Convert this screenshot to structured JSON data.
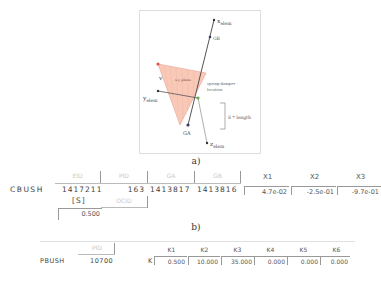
{
  "figure_a": {
    "caption": "a)",
    "labels": {
      "x_elem": "x",
      "x_elem_sub": "elem",
      "y_elem": "y",
      "y_elem_sub": "elem",
      "z_elem": "z",
      "z_elem_sub": "elem",
      "gb": "GB",
      "ga": "GA",
      "plane": "x-y plane",
      "v": "v",
      "spring_damper": "spring-damper",
      "location": "location",
      "s_length": "S * length"
    },
    "colors": {
      "plane_fill": "#f9c9b8",
      "plane_edge": "#e8a090",
      "v_point": "#d9534f",
      "spring_point": "#6ab04c",
      "axis_line": "#555555",
      "node": "#3a3a6a"
    }
  },
  "figure_b": {
    "caption": "b)",
    "card_name": "CBUSH",
    "row1_headers": [
      "EID",
      "PID",
      "GA",
      "GB"
    ],
    "row1_values": [
      "1417211",
      "163",
      "1413817",
      "1413816"
    ],
    "x_headers": [
      "X1",
      "X2",
      "X3"
    ],
    "x_values": [
      "4.7e-02",
      "-2.5e-01",
      "-9.7e-01"
    ],
    "row2_headers": [
      "[S]",
      "OCID"
    ],
    "s_value": "0.500"
  },
  "figure_c": {
    "card_name": "PBUSH",
    "pid_header": "PID",
    "pid_value": "10700",
    "k_label": "K",
    "k_headers": [
      "K1",
      "K2",
      "K3",
      "K4",
      "K5",
      "K6"
    ],
    "k_values": [
      "0.500",
      "10.000",
      "35.000",
      "0.000",
      "0.000",
      "0.000"
    ]
  }
}
